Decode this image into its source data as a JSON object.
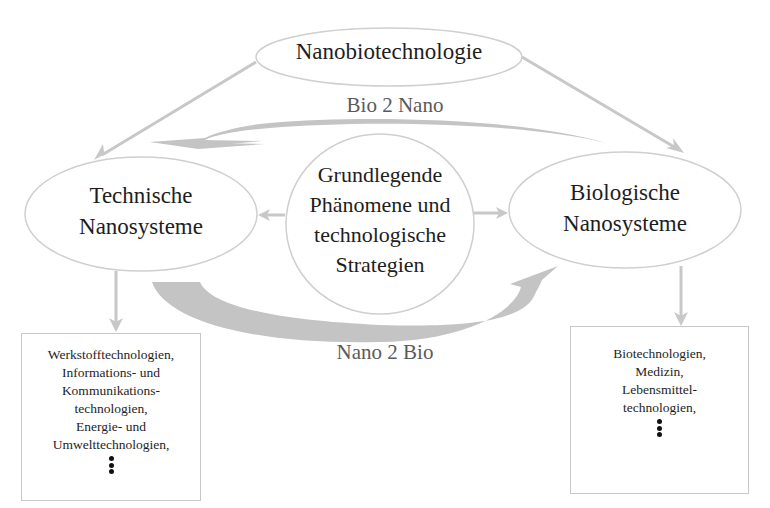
{
  "title_node": {
    "label": "Nanobiotechnologie"
  },
  "left_node": {
    "lines": [
      "Technische",
      "Nanosysteme"
    ]
  },
  "right_node": {
    "lines": [
      "Biologische",
      "Nanosysteme"
    ]
  },
  "center_node": {
    "lines": [
      "Grundlegende",
      "Phänomene und",
      "technologische",
      "Strategien"
    ]
  },
  "arrows": {
    "bio_to_nano": {
      "label": "Bio 2 Nano",
      "direction": "right-to-left"
    },
    "nano_to_bio": {
      "label": "Nano 2 Bio",
      "direction": "left-to-right"
    }
  },
  "left_box": {
    "lines": [
      "Werkstofftechnologien,",
      "Informations- und",
      "Kommunikations-",
      "technologien,",
      "Energie- und",
      "Umwelttechnologien,"
    ],
    "continuation": "vertical-ellipsis"
  },
  "right_box": {
    "lines": [
      "Biotechnologien,",
      "Medizin,",
      "Lebensmittel-",
      "technologien,"
    ],
    "continuation": "vertical-ellipsis"
  },
  "colors": {
    "shape_stroke": "#c8c8c8",
    "arrow_fill": "#c4c4c4",
    "text": "#1e1e1e",
    "arrow_label": "#5a5a5a"
  }
}
